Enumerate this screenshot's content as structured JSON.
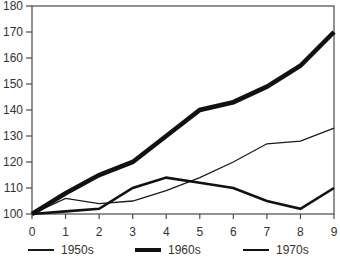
{
  "chart_data": {
    "type": "line",
    "title": "",
    "xlabel": "",
    "ylabel": "",
    "grid": false,
    "legend_position": "bottom",
    "axis_color": "#4a4a4a",
    "label_color": "#333333",
    "xlim": [
      0,
      9
    ],
    "ylim": [
      100,
      180
    ],
    "x_ticks": [
      "0",
      "1",
      "2",
      "3",
      "4",
      "5",
      "6",
      "7",
      "8",
      "9"
    ],
    "y_ticks": [
      "100",
      "110",
      "120",
      "130",
      "140",
      "150",
      "160",
      "170",
      "180"
    ],
    "x": [
      0,
      1,
      2,
      3,
      4,
      5,
      6,
      7,
      8,
      9
    ],
    "series": [
      {
        "name": "1950s",
        "values": [
          100,
          106,
          104,
          105,
          109,
          114,
          120,
          127,
          128,
          133
        ],
        "line_width": 1.3,
        "color": "#1a1a1a"
      },
      {
        "name": "1960s",
        "values": [
          100,
          108,
          115,
          120,
          130,
          140,
          143,
          149,
          157,
          170
        ],
        "line_width": 4.6,
        "color": "#111111"
      },
      {
        "name": "1970s",
        "values": [
          100,
          101,
          102,
          110,
          114,
          112,
          110,
          105,
          102,
          110
        ],
        "line_width": 2.6,
        "color": "#111111"
      }
    ]
  }
}
